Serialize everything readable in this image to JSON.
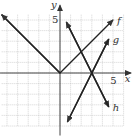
{
  "chart_data": {
    "type": "line",
    "title": "",
    "xlabel": "x",
    "ylabel": "y",
    "xlim": [
      -5.5,
      6
    ],
    "ylim": [
      -5,
      6
    ],
    "grid": true,
    "ticks": {
      "x_label": "5",
      "y_label": "5"
    },
    "series": [
      {
        "name": "f",
        "points": [
          [
            -5.5,
            5.5
          ],
          [
            0,
            0
          ],
          [
            5,
            5
          ]
        ]
      },
      {
        "name": "g",
        "points": [
          [
            0.7,
            -4.6
          ],
          [
            4.6,
            3.2
          ]
        ]
      },
      {
        "name": "h",
        "points": [
          [
            0.6,
            4.8
          ],
          [
            4.6,
            -3.2
          ]
        ]
      }
    ]
  }
}
